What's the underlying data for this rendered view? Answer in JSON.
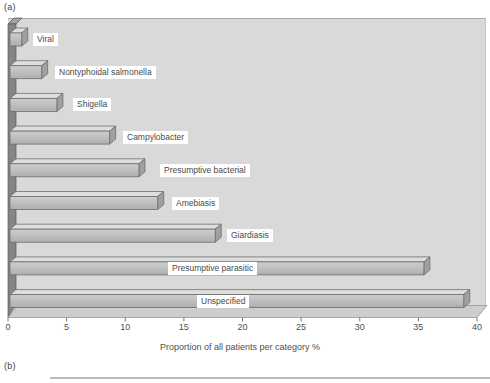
{
  "panel_a_label": "(a)",
  "panel_b_label": "(b)",
  "chart_data": {
    "type": "bar",
    "orientation": "horizontal",
    "style": "3d",
    "title": "",
    "xlabel": "Proportion of all patients per category %",
    "ylabel": "",
    "xlim": [
      0,
      40
    ],
    "xticks": [
      0,
      5,
      10,
      15,
      20,
      25,
      30,
      35,
      40
    ],
    "grid": false,
    "legend": false,
    "categories": [
      "Viral",
      "Nontyphoidal salmonella",
      "Shigella",
      "Campylobacter",
      "Presumptive bacterial",
      "Amebiasis",
      "Giardiasis",
      "Presumptive parasitic",
      "Unspecified"
    ],
    "values": [
      1,
      2.7,
      4,
      8.5,
      11,
      12.6,
      17.5,
      35.3,
      38.7
    ],
    "label_chip_x": [
      33,
      55,
      73,
      123,
      160,
      172,
      227,
      168,
      197
    ],
    "colors": {
      "plot_bg": "#d9d9d9",
      "plot_border_top": "#a8a8a8",
      "plot_border_right": "#c6c6c6",
      "wall_front": "#858585",
      "wall_top": "#a2a2a2",
      "wall_outline": "#565656",
      "floor": "#cdcdcd",
      "floor_outline": "#909090",
      "bar_front_light": "#cdcdcb",
      "bar_front": "#c0c0be",
      "bar_front_dark": "#aeaeac",
      "bar_top": "#dededc",
      "bar_side": "#a0a09e",
      "bar_outline": "#6a6a6a",
      "tick": "#777777",
      "text": "#4a4a4a"
    }
  }
}
